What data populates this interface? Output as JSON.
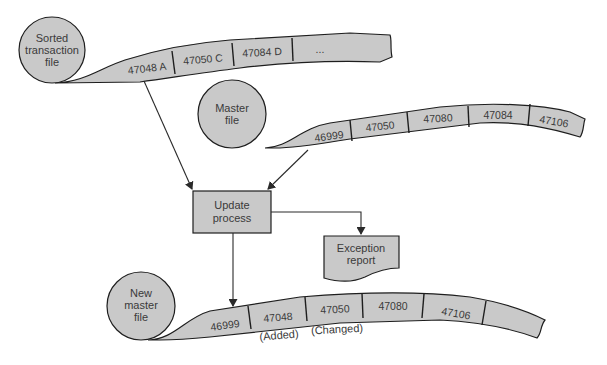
{
  "diagram": {
    "transaction_file": {
      "label_lines": [
        "Sorted",
        "transaction",
        "file"
      ],
      "records": [
        "47048 A",
        "47050 C",
        "47084 D",
        "..."
      ]
    },
    "master_file": {
      "label_lines": [
        "Master",
        "file"
      ],
      "records": [
        "46999",
        "47050",
        "47080",
        "47084",
        "47106"
      ]
    },
    "update_process": {
      "label_lines": [
        "Update",
        "process"
      ]
    },
    "exception_report": {
      "label_lines": [
        "Exception",
        "report"
      ]
    },
    "new_master_file": {
      "label_lines": [
        "New",
        "master",
        "file"
      ],
      "records": [
        "46999",
        "47048",
        "47050",
        "47080",
        "47106"
      ],
      "annotations": [
        "(Added)",
        "(Changed)"
      ]
    },
    "colors": {
      "shape_fill": "#c9c9c9",
      "outline": "#1e1e1e",
      "text": "#3a3a3a"
    }
  }
}
